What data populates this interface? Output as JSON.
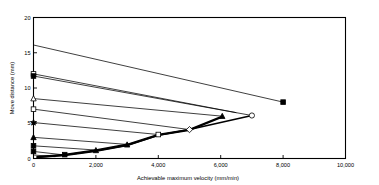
{
  "chart_data": {
    "type": "line",
    "title": "",
    "xlabel": "Achievable maximum velocity (mm/min)",
    "ylabel": "Move distance (mm)",
    "xlim": [
      0,
      10000
    ],
    "ylim": [
      0,
      20
    ],
    "xticks": [
      0,
      2000,
      4000,
      6000,
      8000,
      10000
    ],
    "xticklabels": [
      "0",
      "2,000",
      "4,000",
      "6,000",
      "8,000",
      "10,000"
    ],
    "yticks": [
      0,
      5,
      10,
      15,
      20
    ],
    "yticklabels": [
      "0",
      "5",
      "10",
      "15",
      "20"
    ],
    "grid": false,
    "legend": false,
    "legend_position": "none",
    "series": [
      {
        "name": "accel-limit-1",
        "marker": "none",
        "x": [
          0,
          8000
        ],
        "y": [
          16.1,
          8.0
        ]
      },
      {
        "name": "accel-limit-2",
        "marker": "none",
        "x": [
          0,
          6500
        ],
        "y": [
          12.0,
          6.5
        ]
      },
      {
        "name": "accel-limit-3",
        "marker": "none",
        "x": [
          0,
          7000
        ],
        "y": [
          11.7,
          6.1
        ]
      },
      {
        "name": "accel-limit-4",
        "marker": "none",
        "x": [
          0,
          6050
        ],
        "y": [
          8.5,
          6.0
        ]
      },
      {
        "name": "accel-limit-5",
        "marker": "none",
        "x": [
          0,
          5000
        ],
        "y": [
          7.0,
          4.1
        ]
      },
      {
        "name": "accel-limit-6",
        "marker": "none",
        "x": [
          0,
          4000
        ],
        "y": [
          5.1,
          3.4
        ]
      },
      {
        "name": "accel-limit-7",
        "marker": "none",
        "x": [
          0,
          3000
        ],
        "y": [
          3.0,
          2.0
        ]
      },
      {
        "name": "accel-limit-8",
        "marker": "none",
        "x": [
          0,
          2000
        ],
        "y": [
          1.8,
          1.2
        ]
      },
      {
        "name": "accel-limit-9",
        "marker": "none",
        "x": [
          0,
          1000
        ],
        "y": [
          1.0,
          0.5
        ]
      },
      {
        "name": "accel-limit-10",
        "marker": "none",
        "x": [
          0,
          700
        ],
        "y": [
          0.5,
          0.25
        ]
      },
      {
        "name": "envelope-square",
        "marker": "square",
        "x": [
          100,
          1000,
          2000,
          3000,
          4000,
          5000,
          6050
        ],
        "y": [
          0.25,
          0.55,
          1.2,
          2.0,
          3.4,
          4.1,
          6.0
        ]
      },
      {
        "name": "envelope-triangle",
        "marker": "triangle",
        "x": [
          100,
          1000,
          2000,
          3000,
          4000,
          5000,
          6050
        ],
        "y": [
          0.2,
          0.5,
          1.1,
          1.9,
          3.3,
          4.0,
          5.9
        ]
      },
      {
        "name": "envelope-circle",
        "marker": "circle",
        "x": [
          100,
          1000,
          2000,
          3000,
          4000,
          5000,
          7000
        ],
        "y": [
          0.15,
          0.45,
          1.05,
          1.85,
          3.3,
          4.1,
          6.1
        ]
      }
    ],
    "markers": [
      {
        "shape": "square",
        "x": 0,
        "y": 12.0,
        "filled": false
      },
      {
        "shape": "square",
        "x": 0,
        "y": 11.7,
        "filled": true
      },
      {
        "shape": "triangle",
        "x": 0,
        "y": 8.5,
        "filled": false
      },
      {
        "shape": "square",
        "x": 0,
        "y": 7.0,
        "filled": false
      },
      {
        "shape": "star",
        "x": 0,
        "y": 5.1,
        "filled": true
      },
      {
        "shape": "triangle",
        "x": 0,
        "y": 3.0,
        "filled": true
      },
      {
        "shape": "square",
        "x": 0,
        "y": 1.8,
        "filled": true
      },
      {
        "shape": "square",
        "x": 0,
        "y": 1.0,
        "filled": true
      },
      {
        "shape": "square",
        "x": 1000,
        "y": 0.55,
        "filled": true
      },
      {
        "shape": "triangle",
        "x": 2000,
        "y": 1.15,
        "filled": true
      },
      {
        "shape": "triangle",
        "x": 3000,
        "y": 1.95,
        "filled": true
      },
      {
        "shape": "square",
        "x": 4000,
        "y": 3.4,
        "filled": false
      },
      {
        "shape": "diamond",
        "x": 5000,
        "y": 4.1,
        "filled": false
      },
      {
        "shape": "triangle",
        "x": 6050,
        "y": 6.0,
        "filled": true
      },
      {
        "shape": "circle",
        "x": 7000,
        "y": 6.1,
        "filled": false
      },
      {
        "shape": "square",
        "x": 8000,
        "y": 8.0,
        "filled": true
      }
    ]
  },
  "axes": {
    "x_title": "Achievable maximum velocity (mm/min)",
    "y_title": "Move distance (mm)"
  }
}
